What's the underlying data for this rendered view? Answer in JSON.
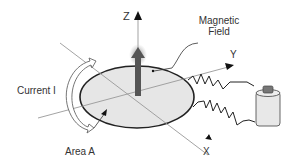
{
  "diagram": {
    "type": "magnetic-moment-current-loop",
    "labels": {
      "z_axis": "Z",
      "y_axis": "Y",
      "x_axis": "X",
      "magnetic_field_line1": "Magnetic",
      "magnetic_field_line2": "Field",
      "current": "Current I",
      "area": "Area A"
    },
    "colors": {
      "loop_fill": "#e6e6e6",
      "loop_stroke": "#222222",
      "axis": "#999999",
      "field_arrow": "#555555",
      "battery_body": "#e8e8e8",
      "battery_cap": "#777777"
    }
  }
}
